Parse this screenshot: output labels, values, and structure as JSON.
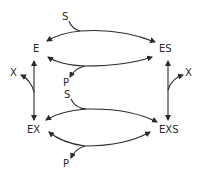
{
  "diagram": {
    "type": "kinetic-scheme",
    "nodes": {
      "E": "E",
      "ES": "ES",
      "EX": "EX",
      "EXS": "EXS"
    },
    "ligands": {
      "top_substrate": "S",
      "top_product": "P",
      "bottom_substrate": "S",
      "bottom_product": "P",
      "left_inhibitor": "X",
      "right_inhibitor": "X"
    },
    "edges": [
      {
        "from": "E",
        "to": "ES",
        "ligand_in": "S",
        "direction": "forward"
      },
      {
        "from": "ES",
        "to": "E",
        "ligand_out": "P",
        "direction": "reverse"
      },
      {
        "from": "EX",
        "to": "EXS",
        "ligand_in": "S",
        "direction": "forward"
      },
      {
        "from": "EXS",
        "to": "EX",
        "ligand_out": "P",
        "direction": "reverse"
      },
      {
        "from": "E",
        "to": "EX",
        "ligand": "X",
        "bidirectional": true
      },
      {
        "from": "ES",
        "to": "EXS",
        "ligand": "X",
        "bidirectional": true
      }
    ],
    "colors": {
      "ink": "#2a2a2a",
      "background": "#ffffff"
    }
  }
}
